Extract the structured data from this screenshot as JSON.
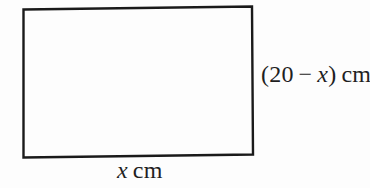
{
  "figure": {
    "type": "geometry-diagram",
    "shape": "rectangle",
    "rect_points": "23.5,9.5 252,6.5 253,154.5 23.5,157.5",
    "labels": {
      "right": {
        "prefix": "(20 − ",
        "variable": "x",
        "suffix": ") cm"
      },
      "bottom": {
        "variable": "x",
        "suffix": " cm"
      }
    },
    "colors": {
      "line": "#1a1a1a",
      "background": "#fdfdfd",
      "text": "#1f1f1f"
    }
  }
}
